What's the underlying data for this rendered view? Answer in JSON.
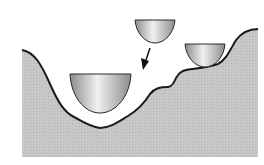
{
  "diagram": {
    "colors": {
      "background": "#ffffff",
      "ground_fill": "#c4c4c4",
      "outline": "#1a1a1a",
      "bowl_light": "#f0f0f0",
      "bowl_dark": "#8c8c8c"
    },
    "elements": [
      {
        "name": "landscape",
        "type": "terrain"
      },
      {
        "name": "bowl-falling",
        "type": "bowl",
        "position": "top-center"
      },
      {
        "name": "bowl-local-minimum",
        "type": "bowl",
        "position": "right-shelf"
      },
      {
        "name": "bowl-global-minimum",
        "type": "bowl",
        "position": "deep-valley"
      },
      {
        "name": "arrow-down",
        "type": "arrow",
        "direction": "down-left"
      }
    ]
  }
}
